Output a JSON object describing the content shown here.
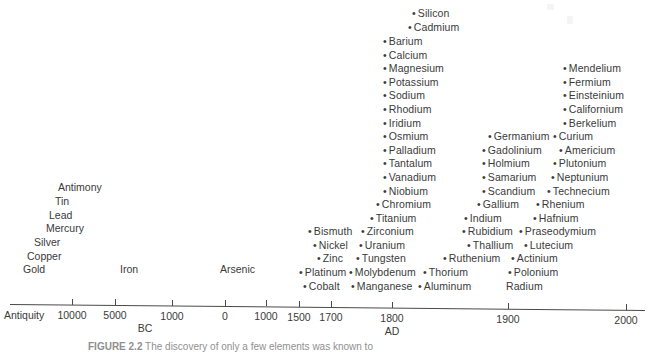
{
  "figure": {
    "caption_label": "FIGURE 2.2",
    "caption_text": "The discovery of only a few elements was known to",
    "axis_start_label": "Antiquity",
    "bullet_glyph": "•"
  },
  "chart_data": {
    "type": "scatter",
    "xlabel": "",
    "ylabel": "",
    "grid": false,
    "legend": "none",
    "axis": {
      "start_label": "Antiquity",
      "era_labels": [
        {
          "text": "BC",
          "x": 145
        },
        {
          "text": "AD",
          "x": 392
        }
      ],
      "ticks": [
        {
          "label": "10000",
          "x": 72
        },
        {
          "label": "5000",
          "x": 115
        },
        {
          "label": "1000",
          "x": 172
        },
        {
          "label": "0",
          "x": 225
        },
        {
          "label": "1000",
          "x": 266
        },
        {
          "label": "1500",
          "x": 299
        },
        {
          "label": "1700",
          "x": 331
        },
        {
          "label": "1800",
          "x": 392
        },
        {
          "label": "1900",
          "x": 508
        },
        {
          "label": "2000",
          "x": 626
        }
      ]
    },
    "antiquity_elements": [
      {
        "name": "Antiquity",
        "x": 6,
        "y": 312,
        "bullet": false,
        "group": "axis-start"
      },
      {
        "name": "Antimony",
        "x": 58,
        "y": 182,
        "bullet": false,
        "group": "antiquity"
      },
      {
        "name": "Tin",
        "x": 55,
        "y": 196,
        "bullet": false,
        "group": "antiquity"
      },
      {
        "name": "Lead",
        "x": 49,
        "y": 210,
        "bullet": false,
        "group": "antiquity"
      },
      {
        "name": "Mercury",
        "x": 46,
        "y": 223,
        "bullet": false,
        "group": "antiquity"
      },
      {
        "name": "Silver",
        "x": 34,
        "y": 237,
        "bullet": false,
        "group": "antiquity"
      },
      {
        "name": "Copper",
        "x": 27,
        "y": 251,
        "bullet": false,
        "group": "antiquity"
      },
      {
        "name": "Gold",
        "x": 23,
        "y": 264,
        "bullet": false,
        "group": "antiquity"
      },
      {
        "name": "Iron",
        "x": 120,
        "y": 264,
        "bullet": false,
        "group": "antiquity"
      },
      {
        "name": "Arsenic",
        "x": 220,
        "y": 264,
        "bullet": false,
        "group": "medieval"
      }
    ],
    "points": [
      {
        "name": "Silicon",
        "x": 412,
        "y": 8
      },
      {
        "name": "Cadmium",
        "x": 408,
        "y": 22
      },
      {
        "name": "Barium",
        "x": 383,
        "y": 36
      },
      {
        "name": "Calcium",
        "x": 383,
        "y": 50
      },
      {
        "name": "Magnesium",
        "x": 383,
        "y": 63
      },
      {
        "name": "Potassium",
        "x": 383,
        "y": 77
      },
      {
        "name": "Sodium",
        "x": 383,
        "y": 90
      },
      {
        "name": "Rhodium",
        "x": 383,
        "y": 104
      },
      {
        "name": "Iridium",
        "x": 383,
        "y": 118
      },
      {
        "name": "Osmium",
        "x": 383,
        "y": 131
      },
      {
        "name": "Palladium",
        "x": 383,
        "y": 145
      },
      {
        "name": "Tantalum",
        "x": 383,
        "y": 158
      },
      {
        "name": "Vanadium",
        "x": 383,
        "y": 172
      },
      {
        "name": "Niobium",
        "x": 383,
        "y": 186
      },
      {
        "name": "Chromium",
        "x": 376,
        "y": 199
      },
      {
        "name": "Titanium",
        "x": 370,
        "y": 213
      },
      {
        "name": "Zirconium",
        "x": 361,
        "y": 226
      },
      {
        "name": "Uranium",
        "x": 359,
        "y": 240
      },
      {
        "name": "Tungsten",
        "x": 356,
        "y": 253
      },
      {
        "name": "Molybdenum",
        "x": 349,
        "y": 267
      },
      {
        "name": "Manganese",
        "x": 351,
        "y": 281
      },
      {
        "name": "Bismuth",
        "x": 308,
        "y": 226
      },
      {
        "name": "Nickel",
        "x": 313,
        "y": 240
      },
      {
        "name": "Zinc",
        "x": 317,
        "y": 253
      },
      {
        "name": "Platinum",
        "x": 299,
        "y": 267
      },
      {
        "name": "Cobalt",
        "x": 303,
        "y": 281
      },
      {
        "name": "Thorium",
        "x": 423,
        "y": 267
      },
      {
        "name": "Aluminum",
        "x": 418,
        "y": 281
      },
      {
        "name": "Germanium",
        "x": 488,
        "y": 131
      },
      {
        "name": "Gadolinium",
        "x": 482,
        "y": 145
      },
      {
        "name": "Holmium",
        "x": 482,
        "y": 158
      },
      {
        "name": "Samarium",
        "x": 482,
        "y": 172
      },
      {
        "name": "Scandium",
        "x": 482,
        "y": 186
      },
      {
        "name": "Gallium",
        "x": 477,
        "y": 199
      },
      {
        "name": "Indium",
        "x": 464,
        "y": 213
      },
      {
        "name": "Rubidium",
        "x": 462,
        "y": 226
      },
      {
        "name": "Thallium",
        "x": 467,
        "y": 240
      },
      {
        "name": "Ruthenium",
        "x": 443,
        "y": 253
      },
      {
        "name": "Curium",
        "x": 553,
        "y": 131
      },
      {
        "name": "Americium",
        "x": 559,
        "y": 145
      },
      {
        "name": "Plutonium",
        "x": 553,
        "y": 158
      },
      {
        "name": "Neptunium",
        "x": 551,
        "y": 172
      },
      {
        "name": "Technecium",
        "x": 547,
        "y": 186
      },
      {
        "name": "Rhenium",
        "x": 536,
        "y": 199
      },
      {
        "name": "Hafnium",
        "x": 533,
        "y": 213
      },
      {
        "name": "Praseodymium",
        "x": 519,
        "y": 226
      },
      {
        "name": "Lutecium",
        "x": 524,
        "y": 240
      },
      {
        "name": "Actinium",
        "x": 511,
        "y": 253
      },
      {
        "name": "Polonium",
        "x": 508,
        "y": 267
      },
      {
        "name": "Radium",
        "x": 506,
        "y": 281,
        "bullet": false
      },
      {
        "name": "Mendelium",
        "x": 563,
        "y": 63
      },
      {
        "name": "Fermium",
        "x": 563,
        "y": 77
      },
      {
        "name": "Einsteinium",
        "x": 563,
        "y": 90
      },
      {
        "name": "Californium",
        "x": 563,
        "y": 104
      },
      {
        "name": "Berkelium",
        "x": 563,
        "y": 118
      }
    ]
  }
}
